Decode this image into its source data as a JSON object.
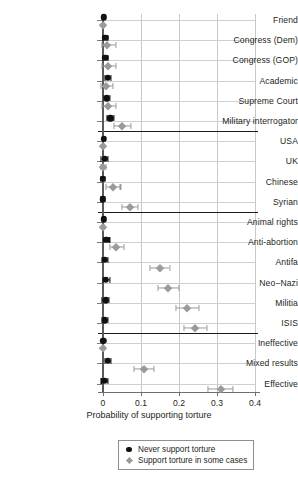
{
  "chart_data": {
    "type": "scatter",
    "title": "",
    "xlabel": "Probability of supporting torture",
    "ylabel": "",
    "xlim": [
      -0.035,
      0.42
    ],
    "xticks": [
      0,
      0.1,
      0.2,
      0.3,
      0.4
    ],
    "xticklabels": [
      "0",
      "0.1",
      "0.2",
      "0.3",
      "0.4"
    ],
    "grid": "both",
    "legend_position": "bottom-center",
    "categories": [
      "Friend",
      "Congress (Dem)",
      "Congress (GOP)",
      "Academic",
      "Supreme Court",
      "Military interrogator",
      "USA",
      "UK",
      "Chinese",
      "Syrian",
      "Animal rights",
      "Anti-abortion",
      "Antifa",
      "Neo−Nazi",
      "Militia",
      "ISIS",
      "Ineffective",
      "Mixed results",
      "Effective"
    ],
    "group_separators_after": [
      "Military interrogator",
      "Syrian",
      "ISIS"
    ],
    "series": [
      {
        "name": "Never support torture",
        "marker": "circle",
        "color": "#111111",
        "values": [
          0.002,
          0.006,
          0.006,
          0.013,
          0.01,
          0.019,
          0.002,
          0.004,
          0.0,
          0.0,
          0.002,
          0.009,
          0.005,
          0.008,
          0.007,
          0.005,
          0.001,
          0.013,
          0.004
        ],
        "ci_low": [
          0.0,
          0.0,
          0.0,
          0.005,
          0.003,
          0.011,
          0.0,
          -0.005,
          -0.006,
          -0.006,
          0.0,
          0.002,
          -0.003,
          -0.001,
          -0.002,
          -0.003,
          0.0,
          0.006,
          -0.004
        ],
        "ci_high": [
          0.004,
          0.012,
          0.012,
          0.022,
          0.018,
          0.028,
          0.005,
          0.013,
          0.006,
          0.006,
          0.004,
          0.017,
          0.014,
          0.018,
          0.016,
          0.014,
          0.003,
          0.021,
          0.013
        ]
      },
      {
        "name": "Support torture in some cases",
        "marker": "diamond",
        "color": "#9a9a9a",
        "values": [
          0.001,
          0.011,
          0.012,
          0.008,
          0.012,
          0.049,
          0.001,
          0.001,
          0.025,
          0.07,
          0.001,
          0.035,
          0.15,
          0.172,
          0.222,
          0.243,
          0.0,
          0.108,
          0.31
        ],
        "ci_low": [
          0.0,
          -0.003,
          -0.002,
          -0.006,
          -0.002,
          0.028,
          0.0,
          -0.004,
          0.008,
          0.05,
          0.0,
          0.018,
          0.124,
          0.145,
          0.192,
          0.212,
          0.0,
          0.082,
          0.277
        ],
        "ci_high": [
          0.003,
          0.033,
          0.035,
          0.026,
          0.033,
          0.073,
          0.003,
          0.008,
          0.046,
          0.093,
          0.003,
          0.056,
          0.175,
          0.2,
          0.252,
          0.274,
          0.002,
          0.135,
          0.343
        ]
      }
    ],
    "legend": [
      {
        "label": "Never support torture",
        "marker": "circle",
        "color": "#111111"
      },
      {
        "label": "Support torture in some cases",
        "marker": "diamond",
        "color": "#9a9a9a"
      }
    ]
  }
}
